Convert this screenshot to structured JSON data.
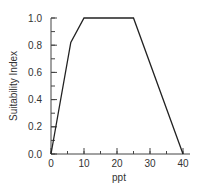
{
  "chart_data": {
    "type": "line",
    "title": "",
    "xlabel": "ppt",
    "ylabel": "Suitability Index",
    "xlim": [
      0,
      40
    ],
    "ylim": [
      0.0,
      1.0
    ],
    "x_ticks": [
      0,
      10,
      20,
      30,
      40
    ],
    "x_tick_labels": [
      "0",
      "10",
      "20",
      "30",
      "40"
    ],
    "x_minor_step": 5,
    "y_ticks": [
      0.0,
      0.2,
      0.4,
      0.6,
      0.8,
      1.0
    ],
    "y_tick_labels": [
      "0.0",
      "0.2",
      "0.4",
      "0.6",
      "0.8",
      "1.0"
    ],
    "y_minor_step": 0.1,
    "grid": false,
    "legend": null,
    "series": [
      {
        "name": "Suitability Index",
        "x": [
          0,
          6,
          10,
          25,
          40
        ],
        "y": [
          0.0,
          0.82,
          1.0,
          1.0,
          0.0
        ]
      }
    ]
  },
  "colors": {
    "line": "#222222",
    "axis": "#444444",
    "text": "#333333",
    "background": "#ffffff"
  }
}
